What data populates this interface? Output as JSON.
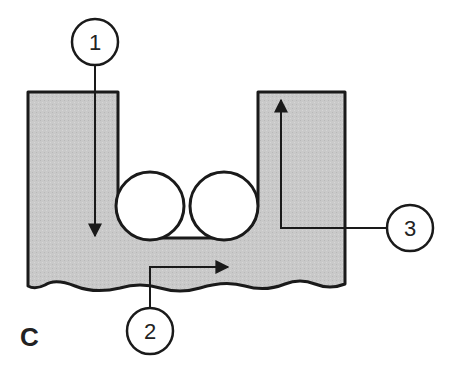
{
  "diagram": {
    "panel_label": "C",
    "colors": {
      "fill": "#c9c9c9",
      "stroke": "#1a1a1a",
      "background": "#ffffff"
    },
    "callouts": [
      {
        "id": "1",
        "label": "1",
        "description": "downward arrow into left wall"
      },
      {
        "id": "2",
        "label": "2",
        "description": "rightward arrow along base"
      },
      {
        "id": "3",
        "label": "3",
        "description": "upward arrow in right wall"
      }
    ],
    "rollers": [
      {
        "label": "roller-left"
      },
      {
        "label": "roller-right"
      }
    ]
  }
}
